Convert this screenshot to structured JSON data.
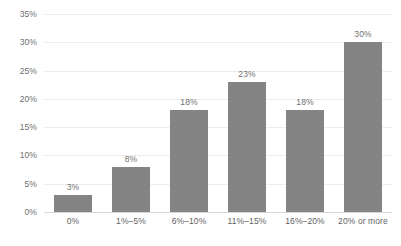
{
  "chart_data": {
    "type": "bar",
    "title": "",
    "subtitle": "",
    "xlabel": "",
    "ylabel": "",
    "categories": [
      "0%",
      "1%–5%",
      "6%–10%",
      "11%–15%",
      "16%–20%",
      "20% or more"
    ],
    "values": [
      3,
      8,
      18,
      23,
      18,
      30
    ],
    "data_labels": [
      "3%",
      "8%",
      "18%",
      "23%",
      "18%",
      "30%"
    ],
    "ylim": [
      0,
      35
    ],
    "ytick_values": [
      0,
      5,
      10,
      15,
      20,
      25,
      30,
      35
    ],
    "ytick_labels": [
      "0%",
      "5%",
      "10%",
      "15%",
      "20%",
      "25%",
      "30%",
      "35%"
    ],
    "grid": true,
    "grid_axis": "y",
    "legend": false,
    "legend_position": "none",
    "bar_color": "#848484",
    "gridline_color": "#ededed",
    "axis_line_color": "#d6d6d6",
    "label_color": "#6f6f6f",
    "background_color": "#ffffff"
  }
}
